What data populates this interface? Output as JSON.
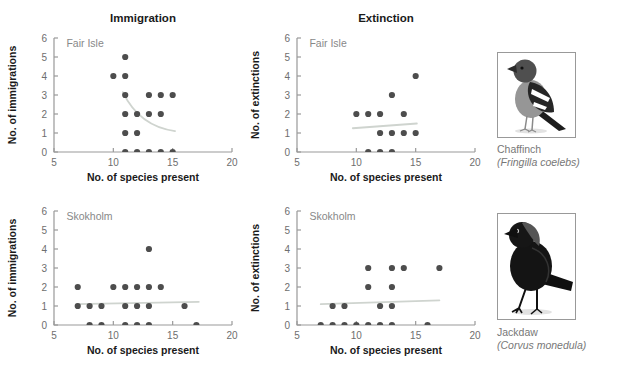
{
  "figure": {
    "columns": [
      {
        "title": "Immigration"
      },
      {
        "title": "Extinction"
      }
    ]
  },
  "chart_data": [
    {
      "id": "fair-isle-immigration",
      "type": "scatter",
      "column_title": "Immigration",
      "island": "Fair Isle",
      "xlabel": "No. of species present",
      "ylabel": "No. of immigrations",
      "xlim": [
        5,
        20
      ],
      "ylim": [
        0,
        6
      ],
      "xticks": [
        5,
        10,
        15,
        20
      ],
      "yticks": [
        0,
        1,
        2,
        3,
        4,
        5,
        6
      ],
      "points": [
        [
          11,
          5
        ],
        [
          10,
          4
        ],
        [
          11,
          4
        ],
        [
          11,
          3
        ],
        [
          13,
          3
        ],
        [
          14,
          3
        ],
        [
          15,
          3
        ],
        [
          11,
          2
        ],
        [
          12,
          2
        ],
        [
          13,
          2
        ],
        [
          14,
          2
        ],
        [
          11,
          1
        ],
        [
          12,
          1
        ],
        [
          11,
          0
        ],
        [
          12,
          0
        ],
        [
          13,
          0
        ],
        [
          14,
          0
        ],
        [
          15,
          0
        ]
      ],
      "trend": {
        "shape": "curve",
        "start": [
          10.8,
          3.15
        ],
        "ctrl": [
          12.2,
          1.35
        ],
        "end": [
          15.2,
          1.1
        ]
      }
    },
    {
      "id": "fair-isle-extinction",
      "type": "scatter",
      "column_title": "Extinction",
      "island": "Fair Isle",
      "xlabel": "No. of species present",
      "ylabel": "No. of extinctions",
      "xlim": [
        5,
        20
      ],
      "ylim": [
        0,
        6
      ],
      "xticks": [
        5,
        10,
        15,
        20
      ],
      "yticks": [
        0,
        1,
        2,
        3,
        4,
        5,
        6
      ],
      "points": [
        [
          15,
          4
        ],
        [
          13,
          3
        ],
        [
          10,
          2
        ],
        [
          11,
          2
        ],
        [
          12,
          2
        ],
        [
          14,
          2
        ],
        [
          12,
          1
        ],
        [
          13,
          1
        ],
        [
          14,
          1
        ],
        [
          15,
          1
        ],
        [
          11,
          0
        ],
        [
          12,
          0
        ],
        [
          13,
          0
        ]
      ],
      "trend": {
        "shape": "line",
        "start": [
          9.7,
          1.25
        ],
        "end": [
          15.1,
          1.5
        ]
      }
    },
    {
      "id": "skokholm-immigration",
      "type": "scatter",
      "island": "Skokholm",
      "xlabel": "No. of species present",
      "ylabel": "No. of immigrations",
      "xlim": [
        5,
        20
      ],
      "ylim": [
        0,
        6
      ],
      "xticks": [
        5,
        10,
        15,
        20
      ],
      "yticks": [
        0,
        1,
        2,
        3,
        4,
        5,
        6
      ],
      "points": [
        [
          13,
          4
        ],
        [
          7,
          2
        ],
        [
          10,
          2
        ],
        [
          11,
          2
        ],
        [
          12,
          2
        ],
        [
          13,
          2
        ],
        [
          14,
          2
        ],
        [
          7,
          1
        ],
        [
          8,
          1
        ],
        [
          9,
          1
        ],
        [
          11,
          1
        ],
        [
          12,
          1
        ],
        [
          13,
          1
        ],
        [
          16,
          1
        ],
        [
          8,
          0
        ],
        [
          9,
          0
        ],
        [
          11,
          0
        ],
        [
          12,
          0
        ],
        [
          13,
          0
        ],
        [
          17,
          0
        ]
      ],
      "trend": {
        "shape": "line",
        "start": [
          6.9,
          1.1
        ],
        "end": [
          17.2,
          1.22
        ]
      }
    },
    {
      "id": "skokholm-extinction",
      "type": "scatter",
      "island": "Skokholm",
      "xlabel": "No. of species present",
      "ylabel": "No. of extinctions",
      "xlim": [
        5,
        20
      ],
      "ylim": [
        0,
        6
      ],
      "xticks": [
        5,
        10,
        15,
        20
      ],
      "yticks": [
        0,
        1,
        2,
        3,
        4,
        5,
        6
      ],
      "points": [
        [
          11,
          3
        ],
        [
          13,
          3
        ],
        [
          14,
          3
        ],
        [
          17,
          3
        ],
        [
          11,
          2
        ],
        [
          13,
          2
        ],
        [
          8,
          1
        ],
        [
          9,
          1
        ],
        [
          12,
          1
        ],
        [
          13,
          1
        ],
        [
          7,
          0
        ],
        [
          8,
          0
        ],
        [
          9,
          0
        ],
        [
          10,
          0
        ],
        [
          11,
          0
        ],
        [
          12,
          0
        ],
        [
          13,
          0
        ],
        [
          16,
          0
        ]
      ],
      "trend": {
        "shape": "line",
        "start": [
          7.0,
          1.1
        ],
        "end": [
          17.0,
          1.3
        ]
      }
    }
  ],
  "birds": [
    {
      "name": "Chaffinch",
      "latin": "(Fringilla coelebs)",
      "icon": "chaffinch-illustration"
    },
    {
      "name": "Jackdaw",
      "latin": "(Corvus monedula)",
      "icon": "jackdaw-illustration"
    }
  ],
  "colors": {
    "point": "#4d4d4d",
    "trend": "#cfd4cf",
    "axis": "#999999",
    "tick_label": "#6e6e6e",
    "island_label": "#888888",
    "text": "#1a1a1a",
    "bird_label": "#777777",
    "bird_box_border": "#999999"
  }
}
